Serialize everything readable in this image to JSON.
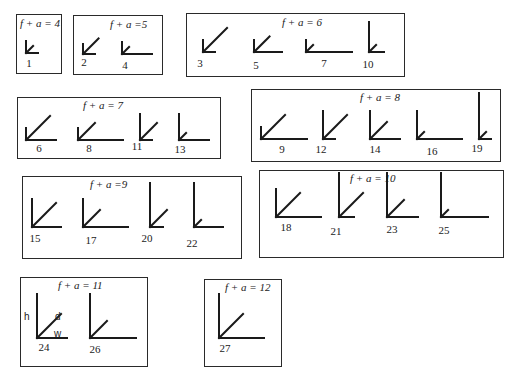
{
  "groups": [
    {
      "title": "f + a = 4",
      "box": [
        16,
        14,
        46,
        60
      ],
      "title_pos": [
        3,
        2
      ],
      "items": [
        {
          "id": "1",
          "cx": 9,
          "cy": 38,
          "h": 12,
          "d": 10,
          "w": 12,
          "nx": 6,
          "ny": 42
        }
      ]
    },
    {
      "title": "f + a =5",
      "box": [
        73,
        15,
        90,
        60
      ],
      "title_pos": [
        36,
        2
      ],
      "items": [
        {
          "id": "2",
          "cx": 9,
          "cy": 38,
          "h": 10,
          "d": 22,
          "w": 12,
          "nx": 4,
          "ny": 40
        },
        {
          "id": "4",
          "cx": 48,
          "cy": 38,
          "h": 12,
          "d": 10,
          "w": 30,
          "nx": 45,
          "ny": 43
        }
      ]
    },
    {
      "title": "f + a = 6",
      "box": [
        186,
        13,
        219,
        64
      ],
      "title_pos": [
        95,
        2
      ],
      "items": [
        {
          "id": "3",
          "cx": 16,
          "cy": 38,
          "h": 12,
          "d": 34,
          "w": 12,
          "nx": 7,
          "ny": 43
        },
        {
          "id": "5",
          "cx": 67,
          "cy": 38,
          "h": 12,
          "d": 22,
          "w": 28,
          "nx": 63,
          "ny": 45
        },
        {
          "id": "7",
          "cx": 119,
          "cy": 38,
          "h": 12,
          "d": 10,
          "w": 46,
          "nx": 131,
          "ny": 43
        },
        {
          "id": "10",
          "cx": 182,
          "cy": 38,
          "h": 30,
          "d": 10,
          "w": 15,
          "nx": 175,
          "ny": 44
        }
      ]
    },
    {
      "title": "f + a = 7",
      "box": [
        17,
        97,
        204,
        62
      ],
      "title_pos": [
        65,
        1
      ],
      "items": [
        {
          "id": "6",
          "cx": 8,
          "cy": 42,
          "h": 12,
          "d": 34,
          "w": 30,
          "nx": 15,
          "ny": 44
        },
        {
          "id": "8",
          "cx": 60,
          "cy": 42,
          "h": 12,
          "d": 24,
          "w": 45,
          "nx": 65,
          "ny": 44
        },
        {
          "id": "11",
          "cx": 122,
          "cy": 42,
          "h": 26,
          "d": 24,
          "w": 12,
          "nx": 113,
          "ny": 42
        },
        {
          "id": "13",
          "cx": 161,
          "cy": 42,
          "h": 26,
          "d": 10,
          "w": 30,
          "nx": 156,
          "ny": 45
        }
      ]
    },
    {
      "title": "f + a = 8",
      "box": [
        251,
        89,
        250,
        73
      ],
      "title_pos": [
        108,
        1
      ],
      "items": [
        {
          "id": "9",
          "cx": 9,
          "cy": 49,
          "h": 12,
          "d": 34,
          "w": 46,
          "nx": 24,
          "ny": 53
        },
        {
          "id": "12",
          "cx": 71,
          "cy": 49,
          "h": 28,
          "d": 34,
          "w": 12,
          "nx": 63,
          "ny": 53
        },
        {
          "id": "14",
          "cx": 118,
          "cy": 49,
          "h": 28,
          "d": 24,
          "w": 30,
          "nx": 117,
          "ny": 53
        },
        {
          "id": "16",
          "cx": 165,
          "cy": 49,
          "h": 28,
          "d": 10,
          "w": 45,
          "nx": 174,
          "ny": 55
        },
        {
          "id": "19",
          "cx": 227,
          "cy": 49,
          "h": 46,
          "d": 10,
          "w": 12,
          "nx": 219,
          "ny": 52
        }
      ]
    },
    {
      "title": "f + a =9",
      "box": [
        22,
        176,
        220,
        83
      ],
      "title_pos": [
        67,
        1
      ],
      "items": [
        {
          "id": "15",
          "cx": 9,
          "cy": 50,
          "h": 28,
          "d": 34,
          "w": 29,
          "nx": 6,
          "ny": 55
        },
        {
          "id": "17",
          "cx": 60,
          "cy": 50,
          "h": 28,
          "d": 24,
          "w": 45,
          "nx": 62,
          "ny": 57
        },
        {
          "id": "20",
          "cx": 127,
          "cy": 50,
          "h": 44,
          "d": 24,
          "w": 13,
          "nx": 118,
          "ny": 55
        },
        {
          "id": "22",
          "cx": 171,
          "cy": 50,
          "h": 44,
          "d": 10,
          "w": 29,
          "nx": 163,
          "ny": 60
        }
      ]
    },
    {
      "title": "f + a = 10",
      "box": [
        259,
        170,
        245,
        88
      ],
      "title_pos": [
        90,
        1
      ],
      "items": [
        {
          "id": "18",
          "cx": 16,
          "cy": 46,
          "h": 28,
          "d": 34,
          "w": 45,
          "nx": 20,
          "ny": 50
        },
        {
          "id": "21",
          "cx": 79,
          "cy": 46,
          "h": 44,
          "d": 34,
          "w": 15,
          "nx": 70,
          "ny": 54
        },
        {
          "id": "23",
          "cx": 127,
          "cy": 46,
          "h": 44,
          "d": 24,
          "w": 31,
          "nx": 126,
          "ny": 52
        },
        {
          "id": "25",
          "cx": 181,
          "cy": 46,
          "h": 44,
          "d": 10,
          "w": 47,
          "nx": 178,
          "ny": 53
        }
      ]
    },
    {
      "title": "f + a = 11",
      "box": [
        20,
        277,
        128,
        90
      ],
      "title_pos": [
        37,
        1
      ],
      "items": [
        {
          "id": "24",
          "cx": 16,
          "cy": 60,
          "h": 44,
          "d": 34,
          "w": 30,
          "nx": 17,
          "ny": 63
        },
        {
          "id": "26",
          "cx": 69,
          "cy": 60,
          "h": 44,
          "d": 24,
          "w": 46,
          "nx": 68,
          "ny": 65
        }
      ],
      "labels": [
        {
          "text": "h",
          "x": 3,
          "y": 33
        },
        {
          "text": "d",
          "x": 34,
          "y": 33
        },
        {
          "text": "w",
          "x": 33,
          "y": 50
        }
      ]
    },
    {
      "title": "f + a = 12",
      "box": [
        204,
        279,
        78,
        88
      ],
      "title_pos": [
        20,
        1
      ],
      "items": [
        {
          "id": "27",
          "cx": 14,
          "cy": 58,
          "h": 44,
          "d": 34,
          "w": 45,
          "nx": 14,
          "ny": 62
        }
      ]
    }
  ]
}
